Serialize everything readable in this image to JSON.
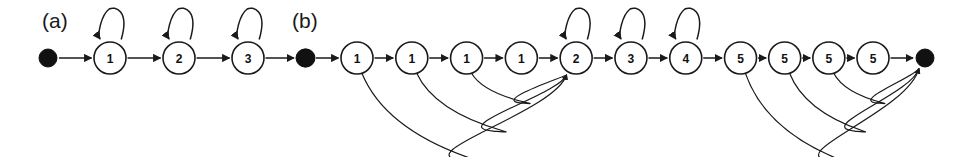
{
  "figure": {
    "background_color": "#ffffff",
    "ink_color": "#1a1a1a",
    "width": 957,
    "height": 157
  },
  "panels": [
    {
      "id": "a",
      "label": "(a)",
      "label_x": 42,
      "label_y": 28,
      "start_node": {
        "name": "start",
        "x": 48,
        "y": 58,
        "r": 9
      },
      "end_node": {
        "name": "end",
        "x": 248,
        "y": 58,
        "r": 9
      },
      "node_radius": 16,
      "nodes": [
        {
          "label": "1",
          "x": 110,
          "y": 58,
          "self_loop": true
        },
        {
          "label": "2",
          "x": 179,
          "y": 58,
          "self_loop": true
        },
        {
          "label": "3",
          "x": 248,
          "y": 58,
          "self_loop": true
        }
      ],
      "skip_edges": []
    },
    {
      "id": "b",
      "label": "(b)",
      "label_x": 292,
      "label_y": 28,
      "start_node": {
        "name": "start",
        "x": 305,
        "y": 58,
        "r": 9
      },
      "end_node": {
        "name": "end",
        "x": 925,
        "y": 58,
        "r": 9
      },
      "node_radius": 16,
      "nodes": [
        {
          "label": "1",
          "x": 357,
          "y": 58,
          "self_loop": false
        },
        {
          "label": "1",
          "x": 424,
          "y": 58,
          "self_loop": false
        },
        {
          "label": "1",
          "x": 491,
          "y": 58,
          "self_loop": false
        },
        {
          "label": "1",
          "x": 558,
          "y": 58,
          "self_loop": false
        },
        {
          "label": "2",
          "x": 625,
          "y": 58,
          "self_loop": true
        },
        {
          "label": "3",
          "x": 692,
          "y": 58,
          "self_loop": true
        },
        {
          "label": "4",
          "x": 759,
          "y": 58,
          "self_loop": true
        },
        {
          "label": "5",
          "x": 826,
          "y": 58,
          "self_loop": false
        },
        {
          "label": "5",
          "x": 880,
          "y": 58,
          "self_loop": false
        },
        {
          "label": "5",
          "x": 934,
          "y": 58,
          "self_loop": false
        },
        {
          "label": "5",
          "x": 988,
          "y": 58,
          "self_loop": false
        }
      ],
      "skip_edges": [
        {
          "from_index": 0,
          "to_index": 4,
          "depth": 88
        },
        {
          "from_index": 1,
          "to_index": 4,
          "depth": 58
        },
        {
          "from_index": 2,
          "to_index": 4,
          "depth": 30
        },
        {
          "from_index": 7,
          "to_index": "end",
          "depth": 88
        },
        {
          "from_index": 8,
          "to_index": "end",
          "depth": 58
        },
        {
          "from_index": 9,
          "to_index": "end",
          "depth": 30
        }
      ]
    }
  ]
}
